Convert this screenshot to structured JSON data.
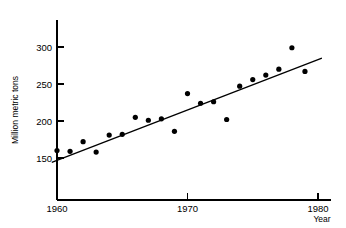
{
  "chart_data": {
    "type": "scatter",
    "title": "",
    "xlabel": "Year",
    "ylabel": "Million metric tons",
    "xlim": [
      1959.0,
      1981.5
    ],
    "ylim": [
      120,
      320
    ],
    "grid": false,
    "legend": null,
    "xticks": [
      1960,
      1970,
      1980
    ],
    "xtick_labels": [
      "1960",
      "1970",
      "1980"
    ],
    "yticks": [
      150,
      200,
      250,
      300
    ],
    "ytick_labels": [
      "150",
      "200",
      "250",
      "300"
    ],
    "series": [
      {
        "name": "observations",
        "marker": "filled-circle",
        "color": "#000000",
        "points": [
          {
            "x": 1960,
            "y": 160
          },
          {
            "x": 1961,
            "y": 159
          },
          {
            "x": 1962,
            "y": 172
          },
          {
            "x": 1963,
            "y": 158
          },
          {
            "x": 1964,
            "y": 181
          },
          {
            "x": 1965,
            "y": 182
          },
          {
            "x": 1966,
            "y": 205
          },
          {
            "x": 1967,
            "y": 201
          },
          {
            "x": 1968,
            "y": 203
          },
          {
            "x": 1969,
            "y": 186
          },
          {
            "x": 1970,
            "y": 237
          },
          {
            "x": 1971,
            "y": 224
          },
          {
            "x": 1972,
            "y": 226
          },
          {
            "x": 1973,
            "y": 202
          },
          {
            "x": 1974,
            "y": 247
          },
          {
            "x": 1975,
            "y": 256
          },
          {
            "x": 1976,
            "y": 262
          },
          {
            "x": 1977,
            "y": 270
          },
          {
            "x": 1978,
            "y": 299
          },
          {
            "x": 1979,
            "y": 267
          }
        ]
      }
    ],
    "trend_line": {
      "name": "least-squares-fit",
      "color": "#000000",
      "x_start": 1959.6,
      "y_start": 144,
      "x_end": 1980.3,
      "y_end": 285
    }
  }
}
